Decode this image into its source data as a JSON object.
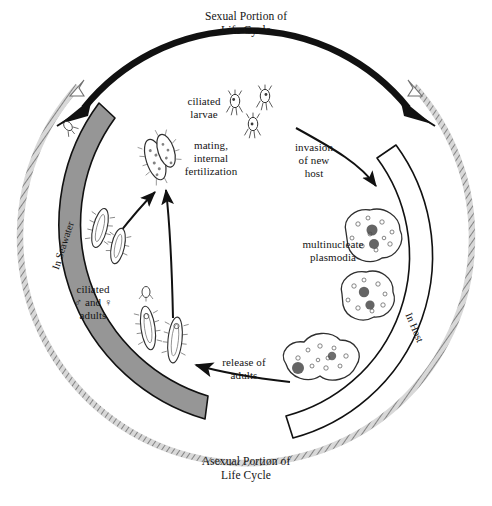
{
  "figure": {
    "type": "life-cycle-diagram",
    "background_color": "#ffffff",
    "ink_color": "#111111",
    "seawater_band_color": "#969696",
    "host_band_color": "#ffffff",
    "hatched_arc_color": "#8d8d8d"
  },
  "labels": {
    "top_title": "Sexual Portion of\nLife Cycle",
    "bottom_title": "Asexual Portion of\nLife Cycle",
    "seawater_band": "In Seawater",
    "host_band": "In Host",
    "ciliated_larvae": "ciliated\nlarvae",
    "mating": "mating,\ninternal\nfertilization",
    "invasion": "invasion\nof new\nhost",
    "plasmodia": "multinucleate\nplasmodia",
    "adults": "ciliated\n♂ and ♀\nadults",
    "release": "release of\nadults"
  },
  "stages": [
    {
      "id": "ciliated-larvae",
      "label": "ciliated larvae",
      "environment": "In Seawater",
      "count_drawn": 3
    },
    {
      "id": "mating-pair",
      "label": "mating, internal fertilization",
      "environment": "In Seawater",
      "count_drawn": 1
    },
    {
      "id": "ciliated-adults",
      "label": "ciliated ♂ and ♀ adults",
      "environment": "In Seawater",
      "count_drawn": 5
    },
    {
      "id": "multinucleate-plasmodia",
      "label": "multinucleate plasmodia",
      "environment": "In Host",
      "count_drawn": 3
    }
  ],
  "transitions": [
    {
      "id": "invasion-of-new-host",
      "label": "invasion of new host",
      "from": "ciliated-larvae",
      "to": "multinucleate-plasmodia"
    },
    {
      "id": "release-of-adults",
      "label": "release of adults",
      "from": "multinucleate-plasmodia",
      "to": "ciliated-adults"
    },
    {
      "id": "adults-to-mating",
      "label": "",
      "from": "ciliated-adults",
      "to": "mating-pair"
    },
    {
      "id": "mating-to-larvae",
      "label": "",
      "from": "mating-pair",
      "to": "ciliated-larvae"
    }
  ],
  "arrows": {
    "sexual_arc_style": "thick solid black arc with arrowheads at both ends",
    "asexual_arc_style": "thin cross-hatched outer arc with arrowheads at both ends"
  }
}
